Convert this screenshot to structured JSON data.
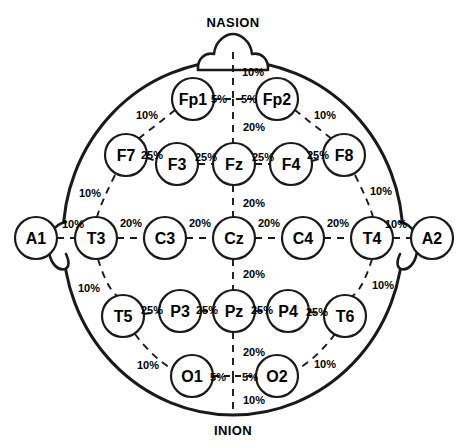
{
  "diagram": {
    "type": "head-map-top-view",
    "colors": {
      "outline": "#1a1a1a",
      "background": "#ffffff",
      "text": "#000000"
    },
    "landmarks": [
      {
        "id": "nasion",
        "label": "NASION",
        "x": 233,
        "y": 22
      },
      {
        "id": "inion",
        "label": "INION",
        "x": 233,
        "y": 430
      }
    ],
    "electrodes": [
      {
        "id": "Fp1",
        "label": "Fp1",
        "x": 193,
        "y": 99,
        "r": 21
      },
      {
        "id": "Fp2",
        "label": "Fp2",
        "x": 277,
        "y": 99,
        "r": 21
      },
      {
        "id": "F7",
        "label": "F7",
        "x": 126,
        "y": 155,
        "r": 21
      },
      {
        "id": "F3",
        "label": "F3",
        "x": 177,
        "y": 164,
        "r": 21
      },
      {
        "id": "Fz",
        "label": "Fz",
        "x": 234,
        "y": 164,
        "r": 21
      },
      {
        "id": "F4",
        "label": "F4",
        "x": 291,
        "y": 164,
        "r": 21
      },
      {
        "id": "F8",
        "label": "F8",
        "x": 344,
        "y": 155,
        "r": 21
      },
      {
        "id": "A1",
        "label": "A1",
        "x": 36,
        "y": 238,
        "r": 21
      },
      {
        "id": "T3",
        "label": "T3",
        "x": 96,
        "y": 238,
        "r": 21
      },
      {
        "id": "C3",
        "label": "C3",
        "x": 165,
        "y": 238,
        "r": 21
      },
      {
        "id": "Cz",
        "label": "Cz",
        "x": 234,
        "y": 238,
        "r": 21
      },
      {
        "id": "C4",
        "label": "C4",
        "x": 303,
        "y": 238,
        "r": 21
      },
      {
        "id": "T4",
        "label": "T4",
        "x": 372,
        "y": 238,
        "r": 21
      },
      {
        "id": "A2",
        "label": "A2",
        "x": 432,
        "y": 238,
        "r": 21
      },
      {
        "id": "T5",
        "label": "T5",
        "x": 123,
        "y": 316,
        "r": 21
      },
      {
        "id": "P3",
        "label": "P3",
        "x": 180,
        "y": 311,
        "r": 21
      },
      {
        "id": "Pz",
        "label": "Pz",
        "x": 234,
        "y": 311,
        "r": 21
      },
      {
        "id": "P4",
        "label": "P4",
        "x": 288,
        "y": 311,
        "r": 21
      },
      {
        "id": "T6",
        "label": "T6",
        "x": 345,
        "y": 316,
        "r": 21
      },
      {
        "id": "O1",
        "label": "O1",
        "x": 192,
        "y": 376,
        "r": 21
      },
      {
        "id": "O2",
        "label": "O2",
        "x": 277,
        "y": 376,
        "r": 21
      }
    ],
    "distance_labels": [
      {
        "id": "nasion-fp-10",
        "text": "10%",
        "x": 253,
        "y": 72
      },
      {
        "id": "fp1-mid-5",
        "text": "5%",
        "x": 219,
        "y": 99
      },
      {
        "id": "mid-fp2-5",
        "text": "5%",
        "x": 249,
        "y": 99
      },
      {
        "id": "fp1-f7-10",
        "text": "10%",
        "x": 147,
        "y": 115
      },
      {
        "id": "fp2-f8-10",
        "text": "10%",
        "x": 325,
        "y": 115
      },
      {
        "id": "fp-fz-20",
        "text": "20%",
        "x": 254,
        "y": 127
      },
      {
        "id": "f7-f3-25",
        "text": "25%",
        "x": 152,
        "y": 155
      },
      {
        "id": "f3-fz-25",
        "text": "25%",
        "x": 206,
        "y": 157
      },
      {
        "id": "fz-f4-25",
        "text": "25%",
        "x": 263,
        "y": 157
      },
      {
        "id": "f4-f8-25",
        "text": "25%",
        "x": 318,
        "y": 155
      },
      {
        "id": "f7-t3-10",
        "text": "10%",
        "x": 90,
        "y": 193
      },
      {
        "id": "f8-t4-10",
        "text": "10%",
        "x": 381,
        "y": 191
      },
      {
        "id": "fz-cz-20",
        "text": "20%",
        "x": 254,
        "y": 203
      },
      {
        "id": "a1-t3-10",
        "text": "10%",
        "x": 73,
        "y": 224
      },
      {
        "id": "t3-c3-20",
        "text": "20%",
        "x": 131,
        "y": 223
      },
      {
        "id": "c3-cz-20",
        "text": "20%",
        "x": 200,
        "y": 223
      },
      {
        "id": "cz-c4-20",
        "text": "20%",
        "x": 269,
        "y": 223
      },
      {
        "id": "c4-t4-20",
        "text": "20%",
        "x": 338,
        "y": 223
      },
      {
        "id": "t4-a2-10",
        "text": "10%",
        "x": 396,
        "y": 224
      },
      {
        "id": "cz-pz-20",
        "text": "20%",
        "x": 254,
        "y": 274
      },
      {
        "id": "t3-t5-10",
        "text": "10%",
        "x": 89,
        "y": 288
      },
      {
        "id": "t4-t6-10",
        "text": "10%",
        "x": 383,
        "y": 285
      },
      {
        "id": "t5-p3-25",
        "text": "25%",
        "x": 152,
        "y": 310
      },
      {
        "id": "p3-pz-25",
        "text": "25%",
        "x": 207,
        "y": 310
      },
      {
        "id": "pz-p4-25",
        "text": "25%",
        "x": 262,
        "y": 310
      },
      {
        "id": "p4-t6-25",
        "text": "25%",
        "x": 317,
        "y": 312
      },
      {
        "id": "pz-o-20",
        "text": "20%",
        "x": 254,
        "y": 352
      },
      {
        "id": "t5-o1-10",
        "text": "10%",
        "x": 148,
        "y": 365
      },
      {
        "id": "t6-o2-10",
        "text": "10%",
        "x": 325,
        "y": 364
      },
      {
        "id": "o1-mid-5",
        "text": "5%",
        "x": 218,
        "y": 377
      },
      {
        "id": "mid-o2-5",
        "text": "5%",
        "x": 250,
        "y": 377
      },
      {
        "id": "o-inion-10",
        "text": "10%",
        "x": 254,
        "y": 400
      }
    ]
  }
}
